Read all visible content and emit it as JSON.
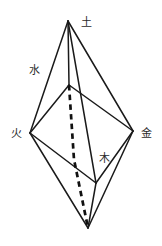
{
  "figure": {
    "background_color": "#ffffff",
    "line_color": "#1a1a1a",
    "hidden_line_color": "#111111",
    "label_color": "#2b2b2b",
    "width": 162,
    "height": 246
  },
  "labels": {
    "top": "土",
    "upper_left": "水",
    "left": "火",
    "right": "金",
    "lower_middle": "木"
  },
  "label_positions": {
    "top": {
      "x": 86,
      "y": 22
    },
    "upper_left": {
      "x": 34,
      "y": 70
    },
    "left": {
      "x": 16,
      "y": 133
    },
    "right": {
      "x": 146,
      "y": 133
    },
    "lower_middle": {
      "x": 104,
      "y": 158
    }
  },
  "vertices": {
    "apex": {
      "x": 68,
      "y": 21,
      "name": "apex-top"
    },
    "inner_top": {
      "x": 69,
      "y": 85,
      "name": "inner-upper"
    },
    "left": {
      "x": 30,
      "y": 133,
      "name": "left"
    },
    "right": {
      "x": 133,
      "y": 131,
      "name": "right"
    },
    "inner_bottom": {
      "x": 96,
      "y": 183,
      "name": "inner-lower"
    },
    "bottom": {
      "x": 88,
      "y": 228,
      "name": "apex-bottom"
    }
  },
  "edges": [
    {
      "from": "apex",
      "to": "left",
      "style": "solid"
    },
    {
      "from": "apex",
      "to": "inner_top",
      "style": "solid"
    },
    {
      "from": "apex",
      "to": "inner_bottom",
      "style": "solid"
    },
    {
      "from": "apex",
      "to": "right",
      "style": "solid"
    },
    {
      "from": "inner_top",
      "to": "left",
      "style": "solid"
    },
    {
      "from": "inner_top",
      "to": "right",
      "style": "solid"
    },
    {
      "from": "left",
      "to": "inner_bottom",
      "style": "solid"
    },
    {
      "from": "right",
      "to": "inner_bottom",
      "style": "solid"
    },
    {
      "from": "bottom",
      "to": "left",
      "style": "solid"
    },
    {
      "from": "bottom",
      "to": "right",
      "style": "solid"
    },
    {
      "from": "bottom",
      "to": "inner_bottom",
      "style": "solid"
    },
    {
      "from": "inner_top",
      "to": "bottom",
      "style": "dashed"
    }
  ]
}
